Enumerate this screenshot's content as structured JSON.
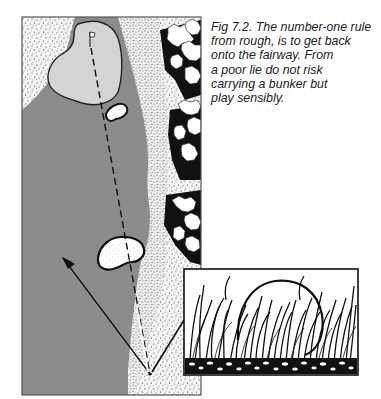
{
  "figure": {
    "label": "Fig 7.2.",
    "caption_lines": [
      "Fig 7.2. The number-one rule",
      "from rough, is to get back",
      "onto the fairway. From",
      "a poor lie do not risk",
      "carrying a bunker but",
      "play sensibly."
    ],
    "elements": {
      "fairway": "fairway",
      "green": "green",
      "flag": "flag",
      "bunkers": [
        "greenside-bunker",
        "fairway-bunker"
      ],
      "trees": "tree-line",
      "rough": "rough",
      "shot_lines": [
        "risky-line-over-bunker",
        "safe-line-to-fairway"
      ],
      "inset": "ball-in-rough-closeup"
    }
  },
  "colors": {
    "fairway": "#8c8c8c",
    "green": "#d4d4d4",
    "rough_bg": "#f4f4f4",
    "ink": "#111111",
    "bunker": "#ffffff",
    "caption_text": "#222222"
  }
}
